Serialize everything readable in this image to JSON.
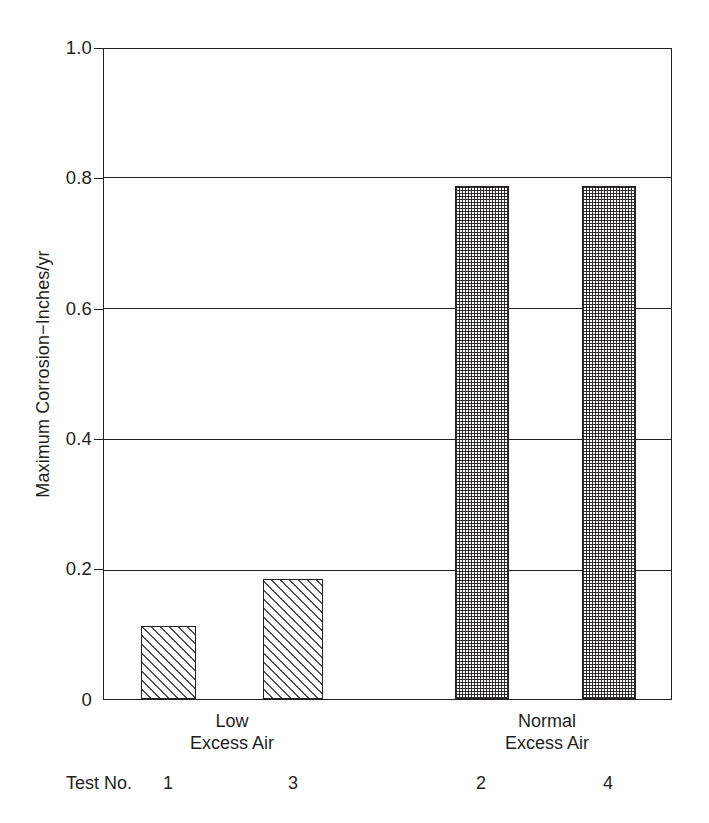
{
  "chart_data": {
    "type": "bar",
    "title": "",
    "xlabel": "",
    "ylabel": "Maximum Corrosion−Inches/yr",
    "ylim": [
      0,
      1.0
    ],
    "yticks": [
      "0",
      "0.2",
      "0.4",
      "0.6",
      "0.8",
      "1.0"
    ],
    "ytick_values": [
      0,
      0.2,
      0.4,
      0.6,
      0.8,
      1.0
    ],
    "grid": "horizontal",
    "legend": "none",
    "categories": [
      "1",
      "3",
      "2",
      "4"
    ],
    "values": [
      0.113,
      0.185,
      0.79,
      0.79
    ],
    "bar_patterns": [
      "hatch",
      "hatch",
      "dots",
      "dots"
    ],
    "groups": [
      {
        "label_line1": "Low",
        "label_line2": "Excess Air",
        "members": [
          "1",
          "3"
        ]
      },
      {
        "label_line1": "Normal",
        "label_line2": "Excess Air",
        "members": [
          "2",
          "4"
        ]
      }
    ],
    "series": [
      {
        "name": "Maximum Corrosion",
        "points": [
          {
            "test_no": "1",
            "group": "Low Excess Air",
            "value": 0.113
          },
          {
            "test_no": "3",
            "group": "Low Excess Air",
            "value": 0.185
          },
          {
            "test_no": "2",
            "group": "Normal Excess Air",
            "value": 0.79
          },
          {
            "test_no": "4",
            "group": "Normal Excess Air",
            "value": 0.79
          }
        ]
      }
    ]
  },
  "axis": {
    "y_title": "Maximum Corrosion−Inches/yr",
    "ticks": [
      {
        "label": "1.0",
        "value": 1.0
      },
      {
        "label": "0.8",
        "value": 0.8
      },
      {
        "label": "0.6",
        "value": 0.6
      },
      {
        "label": "0.4",
        "value": 0.4
      },
      {
        "label": "0.2",
        "value": 0.2
      },
      {
        "label": "0",
        "value": 0
      }
    ]
  },
  "groups": {
    "low": {
      "line1": "Low",
      "line2": "Excess Air"
    },
    "normal": {
      "line1": "Normal",
      "line2": "Excess Air"
    }
  },
  "test_row": {
    "prefix": "Test No.",
    "numbers": [
      "1",
      "3",
      "2",
      "4"
    ]
  },
  "colors": {
    "ink": "#231f20",
    "background": "#ffffff",
    "hatch": "#555555"
  }
}
